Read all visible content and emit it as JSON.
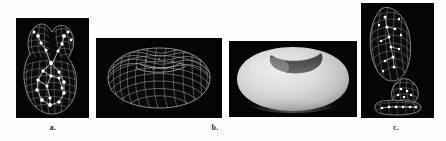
{
  "figure": {
    "background_color": "#ffffff",
    "panel_background_color": "#050505",
    "wireframe_color": "#d8d8d8",
    "node_color": "#ffffff",
    "shaded_surface_light": "#e2e2e2",
    "shaded_surface_mid": "#c9c9c9",
    "shaded_surface_dark": "#9a9a9a",
    "shaded_cavity_color": "#4a4a4a",
    "panels": [
      {
        "id": "panel-a",
        "caption": "a.",
        "render_type": "wireframe-with-skeleton-nodes",
        "description": "Y-shaped branching blob rendered as a white wireframe mesh on black, with bright skeleton node points and connecting segments inside"
      },
      {
        "id": "panel-b",
        "caption": "b.",
        "render_type": "wireframe-quad-mesh",
        "description": "Kidney / bean shaped closed surface drawn as a dense quadrilateral wireframe mesh on black"
      },
      {
        "id": "panel-shaded",
        "caption": "",
        "render_type": "shaded-surface",
        "description": "Same bean shaped surface rendered with smooth grey diffuse shading, showing a dark concave notch on the top"
      },
      {
        "id": "panel-c",
        "caption": "c.",
        "render_type": "wireframe-with-skeleton-nodes",
        "description": "Three separate wireframe components on black: a large tilted elongated ellipsoid, a smaller rounded blob below right, and a small flattened blob with a row of node points at the bottom"
      }
    ],
    "captions": {
      "a": "a.",
      "b": "b.",
      "c": "c."
    }
  }
}
